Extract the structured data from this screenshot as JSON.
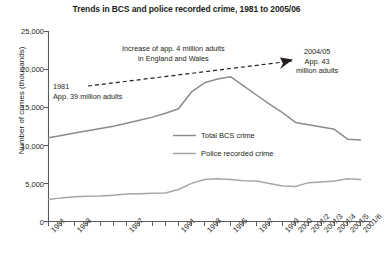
{
  "chart_data": {
    "type": "line",
    "title": "Trends in BCS and police recorded crime, 1981 to 2005/06",
    "xlabel": "",
    "ylabel": "Number of crimes (thousands)",
    "ylim": [
      0,
      25000
    ],
    "ytick_labels": [
      "25,000",
      "20,000",
      "15,000",
      "10,000",
      "5,000",
      "0"
    ],
    "ytick_values": [
      25000,
      20000,
      15000,
      10000,
      5000,
      0
    ],
    "grid": false,
    "legend_position": "center",
    "x": [
      "1981",
      "1982",
      "1983",
      "1984",
      "1985",
      "1986",
      "1987",
      "1988",
      "1989",
      "1990",
      "1991",
      "1992",
      "1993",
      "1994",
      "1995",
      "1996",
      "1997",
      "1998",
      "1999",
      "2000",
      "2001/2",
      "2001/3",
      "2001/4",
      "2001/5",
      "2001/6"
    ],
    "xtick_labels": [
      "1981",
      "1983",
      "1987",
      "1991",
      "1993",
      "1995",
      "1997",
      "1999",
      "2000",
      "2001/2",
      "2001/3",
      "2001/4",
      "2001/5",
      "2001/6"
    ],
    "series": [
      {
        "name": "Total BCS crime",
        "values": [
          11000,
          11300,
          11600,
          11900,
          12200,
          12500,
          12900,
          13300,
          13700,
          14200,
          14800,
          17000,
          18200,
          18700,
          19000,
          17800,
          16600,
          15400,
          14300,
          13000,
          12700,
          12400,
          12100,
          10800,
          10700
        ]
      },
      {
        "name": "Police recorded crime",
        "values": [
          2900,
          3100,
          3250,
          3300,
          3350,
          3450,
          3600,
          3650,
          3700,
          3750,
          4200,
          5000,
          5500,
          5600,
          5500,
          5350,
          5300,
          5000,
          4650,
          4600,
          5100,
          5200,
          5300,
          5600,
          5500
        ]
      }
    ],
    "annotations": [
      {
        "name": "increase-note",
        "lines": [
          "Increase of app. 4 million adults",
          "in England and Wales"
        ]
      },
      {
        "name": "start-note",
        "lines": [
          "1981",
          "App. 39 million adults"
        ]
      },
      {
        "name": "end-note",
        "lines": [
          "2004/05",
          "App. 43",
          "million adults"
        ]
      }
    ]
  },
  "colors": {
    "axis": "#58595b",
    "series_bcs": "#8c8c8c",
    "series_police": "#a6a6a6",
    "text": "#231f20",
    "arrow": "#231f20"
  }
}
